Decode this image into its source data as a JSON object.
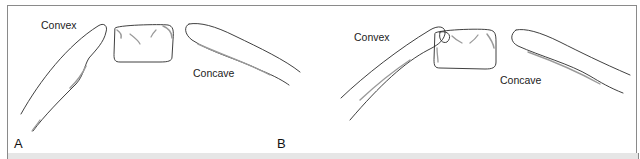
{
  "figure": {
    "panels": [
      {
        "id": "A",
        "label": "A",
        "convex_label": "Convex",
        "concave_label": "Concave"
      },
      {
        "id": "B",
        "label": "B",
        "convex_label": "Convex",
        "concave_label": "Concave"
      }
    ]
  },
  "colors": {
    "stroke": "#2a2a2a",
    "shade": "#9a9a9a",
    "border": "#8a8a8a",
    "band": "#e6e6e6"
  }
}
